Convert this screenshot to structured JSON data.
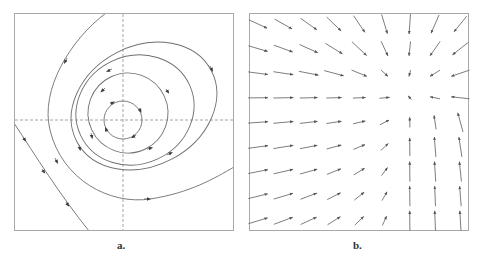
{
  "figure": {
    "panels": [
      {
        "id": "a",
        "label": "a.",
        "description": "Phase portrait: nested closed orbits around a center with separatrix-like curves",
        "axes": {
          "style": "dashed",
          "origin_px": [
            123,
            120
          ]
        },
        "orbits": [
          {
            "name": "inner-circle",
            "direction": "clockwise"
          },
          {
            "name": "middle-ellipse",
            "direction": "clockwise"
          },
          {
            "name": "outer-ellipse",
            "direction": "clockwise"
          },
          {
            "name": "open-curve",
            "direction": "counter-clockwise-sweep"
          },
          {
            "name": "lower-left-trajectory",
            "direction": "down-right"
          }
        ]
      },
      {
        "id": "b",
        "label": "b.",
        "description": "Vector field (9x9 arrow grid) converging toward a point in the upper right",
        "grid": {
          "cols": 9,
          "rows": 9
        },
        "sink_px": [
          405,
          92
        ]
      }
    ],
    "colors": {
      "stroke": "#6e6e6e",
      "axis": "#9a9a9a",
      "border": "#a8a8a8",
      "arrow_head": "#3c3c3c"
    }
  }
}
